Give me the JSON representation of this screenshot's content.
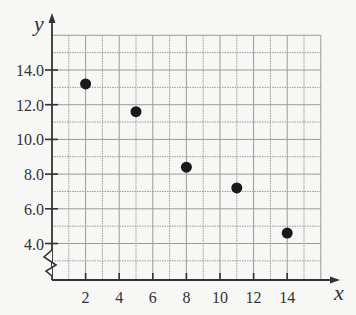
{
  "chart_data": {
    "type": "scatter",
    "title": "",
    "xlabel": "x",
    "ylabel": "y",
    "x": [
      2,
      5,
      8,
      11,
      14
    ],
    "y": [
      13.2,
      11.6,
      8.4,
      7.2,
      4.6
    ],
    "points": [
      {
        "x": 2,
        "y": 13.2
      },
      {
        "x": 5,
        "y": 11.6
      },
      {
        "x": 8,
        "y": 8.4
      },
      {
        "x": 11,
        "y": 7.2
      },
      {
        "x": 14,
        "y": 4.6
      }
    ],
    "x_ticks": [
      "2",
      "4",
      "6",
      "8",
      "10",
      "12",
      "14"
    ],
    "y_ticks": [
      "4.0",
      "6.0",
      "8.0",
      "10.0",
      "12.0",
      "14.0"
    ],
    "xlim": [
      0,
      16
    ],
    "ylim": [
      2,
      16
    ],
    "y_axis_break": true,
    "grid": true,
    "legend": null,
    "colors": {
      "point": "#1a1a1a",
      "axis": "#333333",
      "grid": "#9a9a9a",
      "background": "#f7f7f5"
    }
  }
}
